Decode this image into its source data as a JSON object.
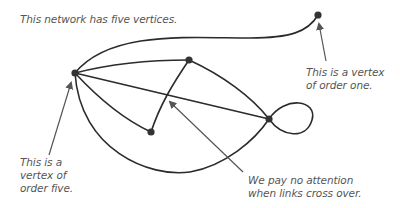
{
  "annotations": {
    "title": "This network has five vertices.",
    "order_one": "This is a vertex\nof order one.",
    "order_five": "This is a\nvertex of\norder five.",
    "crossing": "We pay no attention\nwhen links cross over."
  },
  "graph": {
    "vertices": [
      {
        "id": "A",
        "x": 75,
        "y": 73,
        "order": 5
      },
      {
        "id": "B",
        "x": 189,
        "y": 60
      },
      {
        "id": "C",
        "x": 151,
        "y": 132
      },
      {
        "id": "D",
        "x": 269,
        "y": 119
      },
      {
        "id": "E",
        "x": 318,
        "y": 15,
        "order": 1
      }
    ],
    "edges": [
      [
        "A",
        "E"
      ],
      [
        "A",
        "B"
      ],
      [
        "A",
        "D"
      ],
      [
        "A",
        "C"
      ],
      [
        "A",
        "D"
      ],
      [
        "B",
        "C"
      ],
      [
        "B",
        "D"
      ],
      [
        "D",
        "D"
      ]
    ]
  },
  "colors": {
    "edge": "#2b2b2b",
    "vertex": "#333333",
    "arrow": "#555555",
    "text": "#555555"
  }
}
